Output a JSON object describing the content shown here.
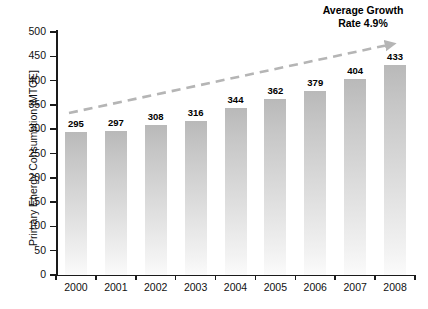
{
  "chart_data": {
    "type": "bar",
    "title": "",
    "subtitle": "",
    "xlabel": "",
    "ylabel": "Primary Energy Consumption [MTOE]",
    "categories": [
      "2000",
      "2001",
      "2002",
      "2003",
      "2004",
      "2005",
      "2006",
      "2007",
      "2008"
    ],
    "values": [
      295,
      297,
      308,
      316,
      344,
      362,
      379,
      404,
      433
    ],
    "value_labels": [
      "295",
      "297",
      "308",
      "316",
      "344",
      "362",
      "379",
      "404",
      "433"
    ],
    "ylim": [
      0,
      500
    ],
    "y_ticks": [
      0,
      50,
      100,
      150,
      200,
      250,
      300,
      350,
      400,
      450,
      500
    ],
    "y_tick_labels": [
      "0",
      "50",
      "100",
      "150",
      "200",
      "250",
      "300",
      "350",
      "400",
      "450",
      "500"
    ],
    "grid": false,
    "legend": null,
    "legend_position": "none",
    "annotations": [
      {
        "name": "average-growth-rate",
        "line1": "Average Growth",
        "line2": "Rate 4.9%",
        "style": "dashed-arrow-trendline"
      }
    ],
    "series_color": "#c8c8c8",
    "trend_color": "#b5b5b5",
    "axis_color": "#1a1a1a"
  }
}
